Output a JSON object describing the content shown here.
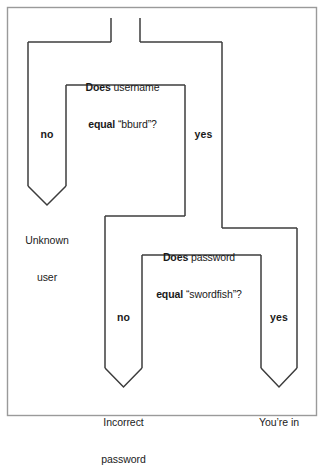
{
  "diagram": {
    "type": "flowchart",
    "line_color": "#3c3c3c",
    "frame_color": "#9a9a9a",
    "text_color": "#1a1a1a",
    "background": "#ffffff"
  },
  "nodes": {
    "decision_username": {
      "kind": "decision",
      "line1_bold": "Does",
      "line1_rest": " username",
      "line2_bold": "equal",
      "line2_rest": " “bburd”?",
      "full_text": "Does username equal “bburd”?"
    },
    "decision_password": {
      "kind": "decision",
      "line1_bold": "Does",
      "line1_rest": " password",
      "line2_bold": "equal",
      "line2_rest": " “swordfish”?",
      "full_text": "Does password equal “swordfish”?"
    },
    "terminal_unknown_user": {
      "kind": "terminal",
      "line1": "Unknown",
      "line2": "user"
    },
    "terminal_incorrect_password": {
      "kind": "terminal",
      "line1": "Incorrect",
      "line2": "password"
    },
    "terminal_youre_in": {
      "kind": "terminal",
      "line1": "You’re in",
      "line2": ""
    }
  },
  "branches": {
    "username_no": "no",
    "username_yes": "yes",
    "password_no": "no",
    "password_yes": "yes"
  }
}
